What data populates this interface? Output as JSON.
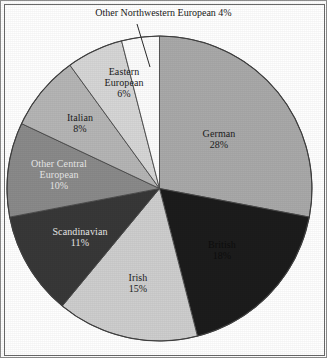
{
  "figure": {
    "callout": {
      "text": "Other Northwestern European 4%",
      "leader_line": "leader-line"
    },
    "frame_color": "#6a6a6a",
    "background": "#ffffff"
  },
  "chart_data": {
    "type": "pie",
    "title": "",
    "subtitle": "",
    "xlabel": "",
    "ylabel": "",
    "legend": "none",
    "grid": false,
    "start_angle_deg": 0,
    "direction": "clockwise",
    "units": "percent",
    "total": 100,
    "categories": [
      "German",
      "British",
      "Irish",
      "Scandinavian",
      "Other Central European",
      "Italian",
      "Eastern European",
      "Other Northwestern European"
    ],
    "values": [
      28,
      18,
      15,
      11,
      10,
      8,
      6,
      4
    ],
    "colors": [
      "#a9a9a9",
      "#1c1c1c",
      "#cecece",
      "#383838",
      "#8a8a8a",
      "#b5b5b5",
      "#d6d6d6",
      "#fdfdfd"
    ],
    "slices": [
      {
        "name": "German",
        "value": 28,
        "label_name": "German",
        "label_value": "28%",
        "color": "#a9a9a9",
        "label_placement": "inside",
        "label_tone": "light-slice"
      },
      {
        "name": "British",
        "value": 18,
        "label_name": "British",
        "label_value": "18%",
        "color": "#1c1c1c",
        "label_placement": "inside",
        "label_tone": "dark-slice"
      },
      {
        "name": "Irish",
        "value": 15,
        "label_name": "Irish",
        "label_value": "15%",
        "color": "#cecece",
        "label_placement": "inside",
        "label_tone": "light-slice"
      },
      {
        "name": "Scandinavian",
        "value": 11,
        "label_name": "Scandinavian",
        "label_value": "11%",
        "color": "#383838",
        "label_placement": "inside",
        "label_tone": "dark-slice"
      },
      {
        "name": "Other Central European",
        "value": 10,
        "label_name_line1": "Other Central",
        "label_name_line2": "European",
        "label_value": "10%",
        "color": "#8a8a8a",
        "label_placement": "inside",
        "label_tone": "dark-slice"
      },
      {
        "name": "Italian",
        "value": 8,
        "label_name": "Italian",
        "label_value": "8%",
        "color": "#b5b5b5",
        "label_placement": "inside",
        "label_tone": "light-slice"
      },
      {
        "name": "Eastern European",
        "value": 6,
        "label_name_line1": "Eastern",
        "label_name_line2": "European",
        "label_value": "6%",
        "color": "#d6d6d6",
        "label_placement": "inside",
        "label_tone": "light-slice"
      },
      {
        "name": "Other Northwestern European",
        "value": 4,
        "label_name": "Other Northwestern European",
        "label_value": "4%",
        "color": "#fdfdfd",
        "label_placement": "outside-callout",
        "label_tone": "light-slice"
      }
    ]
  }
}
